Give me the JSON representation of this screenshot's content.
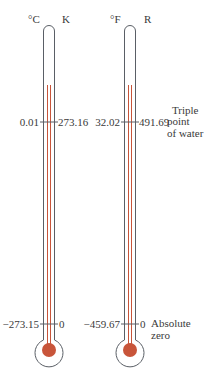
{
  "diagram": {
    "colors": {
      "outline": "#5a5f66",
      "mercury": "#c8553a",
      "background": "#ffffff"
    },
    "thermometers": [
      {
        "id": "celsius-kelvin",
        "left_unit": "°C",
        "right_unit": "K",
        "marks": [
          {
            "point": "triple_point",
            "left_value": "0.01",
            "right_value": "273.16"
          },
          {
            "point": "absolute_zero",
            "left_value": "−273.15",
            "right_value": "0"
          }
        ]
      },
      {
        "id": "fahrenheit-rankine",
        "left_unit": "°F",
        "right_unit": "R",
        "marks": [
          {
            "point": "triple_point",
            "left_value": "32.02",
            "right_value": "491.69"
          },
          {
            "point": "absolute_zero",
            "left_value": "−459.67",
            "right_value": "0"
          }
        ]
      }
    ],
    "annotations": {
      "triple_point": [
        "Triple",
        "point",
        "of water"
      ],
      "absolute_zero": [
        "Absolute",
        "zero"
      ]
    }
  }
}
